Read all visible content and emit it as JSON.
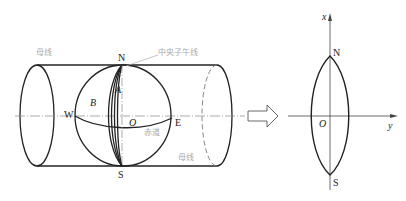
{
  "figure": {
    "left_panel": {
      "title": "Transverse cylinder tangent to the sphere along central meridian",
      "labels": {
        "generatrix_top": "母线",
        "generatrix_bottom": "母线",
        "central_meridian": "中央子午线",
        "equator": "赤道",
        "north": "N",
        "south": "S",
        "west": "W",
        "east": "E",
        "origin": "O",
        "point_a": "A",
        "point_b": "B"
      }
    },
    "arrow": {
      "direction": "right"
    },
    "right_panel": {
      "labels": {
        "x_axis": "x",
        "y_axis": "y",
        "north": "N",
        "south": "S",
        "origin": "O"
      }
    },
    "colors": {
      "line": "#222222",
      "guide": "#888888",
      "annotation": "#aaaaaa"
    }
  }
}
